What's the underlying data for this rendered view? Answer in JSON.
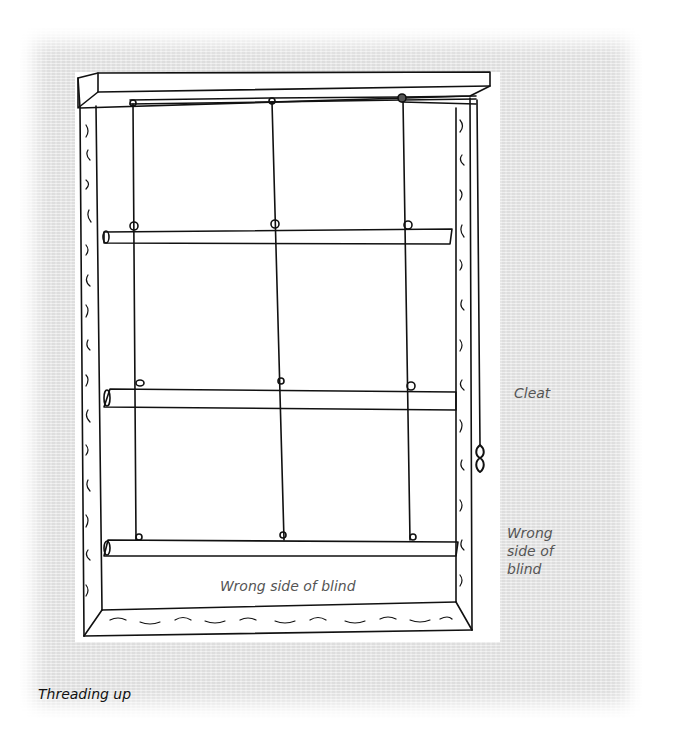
{
  "figure": {
    "title": "Threading up",
    "labels": {
      "cleat": "Cleat",
      "wrong_side_right_line1": "Wrong",
      "wrong_side_right_line2": "side of",
      "wrong_side_right_line3": "blind",
      "wrong_side_center": "Wrong side of blind"
    },
    "components": [
      "headboard",
      "window-frame",
      "cords",
      "dowel-rods",
      "rings",
      "cleat",
      "bottom-batten"
    ],
    "colors": {
      "ink": "#111111",
      "paper": "#e9e9e9",
      "white": "#ffffff",
      "label_text": "#555555"
    }
  }
}
